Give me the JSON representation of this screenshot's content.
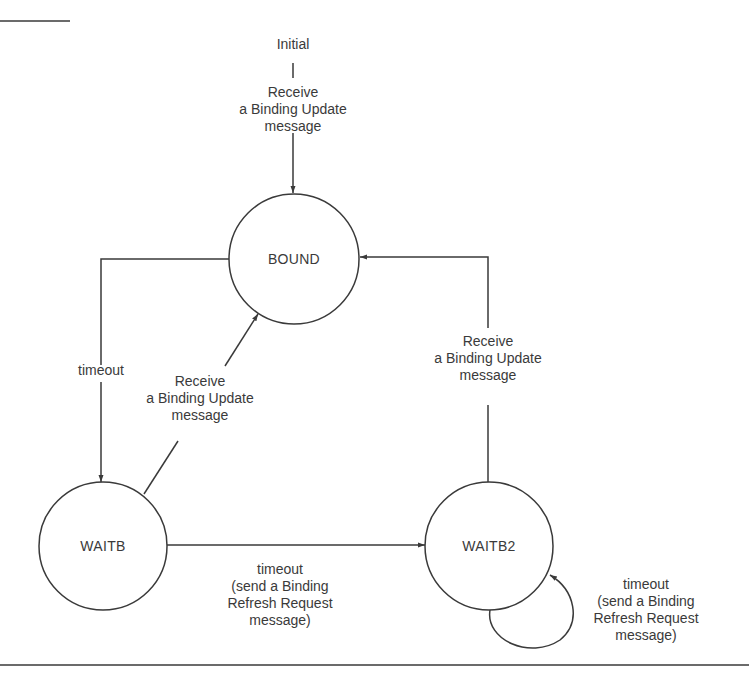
{
  "diagram": {
    "type": "state-machine",
    "states": [
      {
        "id": "bound",
        "label": "BOUND"
      },
      {
        "id": "waitb",
        "label": "WAITB"
      },
      {
        "id": "waitb2",
        "label": "WAITB2"
      }
    ],
    "initial": {
      "label": "Initial",
      "transition_label": "Receive\na Binding Update\nmessage"
    },
    "transitions": [
      {
        "from": "bound",
        "to": "waitb",
        "label": "timeout"
      },
      {
        "from": "waitb",
        "to": "bound",
        "label": "Receive\na Binding Update\nmessage"
      },
      {
        "from": "waitb",
        "to": "waitb2",
        "label": "timeout\n(send a Binding\nRefresh Request\nmessage)"
      },
      {
        "from": "waitb2",
        "to": "bound",
        "label": "Receive\na Binding Update\nmessage"
      },
      {
        "from": "waitb2",
        "to": "waitb2",
        "label": "timeout\n(send a Binding\nRefresh Request\nmessage)"
      }
    ]
  },
  "colors": {
    "stroke": "#3a3a3a",
    "text": "#3a3a3a",
    "background": "#ffffff"
  }
}
